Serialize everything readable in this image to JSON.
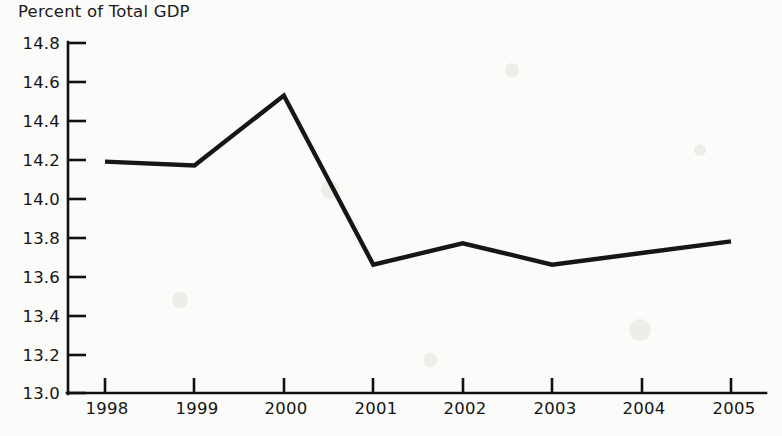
{
  "chart_data": {
    "type": "line",
    "title": "Percent of Total GDP",
    "xlabel": "",
    "ylabel": "",
    "categories": [
      "1998",
      "1999",
      "2000",
      "2001",
      "2002",
      "2003",
      "2004",
      "2005"
    ],
    "values": [
      14.19,
      14.17,
      14.53,
      13.66,
      13.77,
      13.66,
      13.72,
      13.78
    ],
    "series": [
      {
        "name": "Percent of Total GDP",
        "values": [
          14.19,
          14.17,
          14.53,
          13.66,
          13.77,
          13.66,
          13.72,
          13.78
        ]
      }
    ],
    "ylim": [
      13.0,
      14.8
    ],
    "ytick_labels": [
      "14.8",
      "14.6",
      "14.4",
      "14.2",
      "14.0",
      "13.8",
      "13.6",
      "13.4",
      "13.2",
      "13.0"
    ],
    "ytick_values": [
      14.8,
      14.6,
      14.4,
      14.2,
      14.0,
      13.8,
      13.6,
      13.4,
      13.2,
      13.0
    ],
    "xtick_labels": [
      "1998",
      "1999",
      "2000",
      "2001",
      "2002",
      "2003",
      "2004",
      "2005"
    ],
    "grid": false,
    "legend": false,
    "legend_position": "none",
    "line_color": "#161616",
    "background_color": "#fbfbfa",
    "axis_color": "#111111"
  },
  "axes": {
    "y_axis_name": "y-axis",
    "x_axis_name": "x-axis"
  }
}
